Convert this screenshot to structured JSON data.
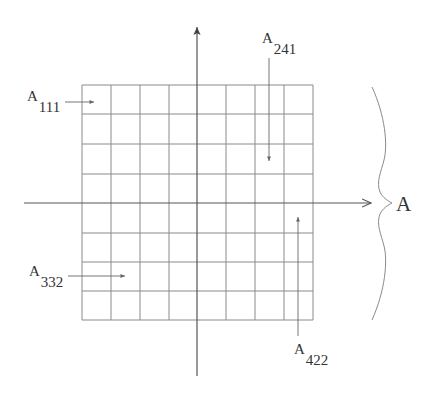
{
  "diagram": {
    "title": "",
    "grid": {
      "columns": 8,
      "rows": 8,
      "x_lines": [
        82,
        111,
        140,
        169,
        197,
        226,
        255,
        284,
        313
      ],
      "y_lines": [
        85,
        114,
        144,
        174,
        203,
        233,
        262,
        291,
        320
      ],
      "line_color": "#8a8a8a"
    },
    "axes": {
      "color": "#555555",
      "horizontal": {
        "x1": 24,
        "x2": 371,
        "y": 203,
        "arrow": "right"
      },
      "vertical": {
        "x": 197,
        "y1": 376,
        "y2": 27,
        "arrow": "up"
      }
    },
    "brace": {
      "side": "right",
      "label": "A",
      "color": "#8a8a8a"
    },
    "labels": [
      {
        "id": "a111",
        "main": "A",
        "sub": "111",
        "arrow_direction": "right"
      },
      {
        "id": "a241",
        "main": "A",
        "sub": "241",
        "arrow_direction": "down"
      },
      {
        "id": "a332",
        "main": "A",
        "sub": "332",
        "arrow_direction": "right"
      },
      {
        "id": "a422",
        "main": "A",
        "sub": "422",
        "arrow_direction": "up"
      }
    ]
  }
}
